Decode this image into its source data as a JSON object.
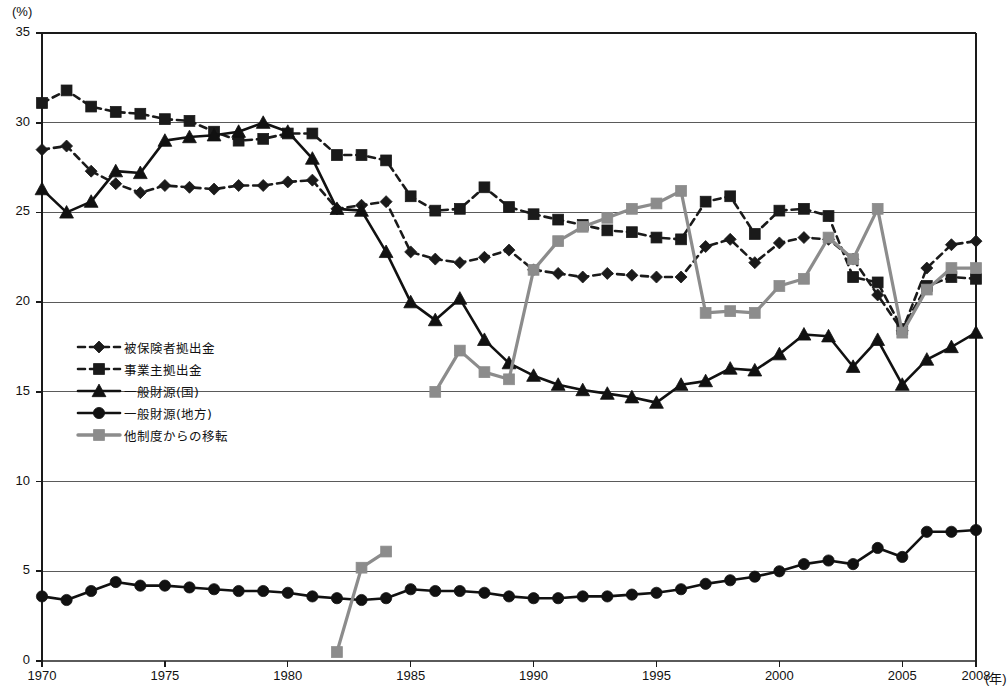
{
  "chart_data": {
    "type": "line",
    "title": "",
    "xlabel": "(年)",
    "ylabel": "(%)",
    "unit_y": "(%)",
    "unit_x": "(年)",
    "xlim": [
      1970,
      2008
    ],
    "ylim": [
      0,
      35
    ],
    "ytick_step": 5,
    "yticks": [
      "0",
      "5",
      "10",
      "15",
      "20",
      "25",
      "30",
      "35"
    ],
    "xticks": [
      "1970",
      "1975",
      "1980",
      "1985",
      "1990",
      "1995",
      "2000",
      "2005",
      "2008"
    ],
    "xtick_values": [
      1970,
      1975,
      1980,
      1985,
      1990,
      1995,
      2000,
      2005,
      2008
    ],
    "grid": "horizontal",
    "legend_position": "inside-left",
    "x": [
      1970,
      1971,
      1972,
      1973,
      1974,
      1975,
      1976,
      1977,
      1978,
      1979,
      1980,
      1981,
      1982,
      1983,
      1984,
      1985,
      1986,
      1987,
      1988,
      1989,
      1990,
      1991,
      1992,
      1993,
      1994,
      1995,
      1996,
      1997,
      1998,
      1999,
      2000,
      2001,
      2002,
      2003,
      2004,
      2005,
      2006,
      2007,
      2008
    ],
    "series": [
      {
        "name": "被保険者拠出金",
        "marker": "diamond",
        "line": "dashed",
        "color": "#1a1a1a",
        "values": [
          28.5,
          28.7,
          27.3,
          26.6,
          26.1,
          26.5,
          26.4,
          26.3,
          26.5,
          26.5,
          26.7,
          26.8,
          25.2,
          25.4,
          25.6,
          22.8,
          22.4,
          22.2,
          22.5,
          22.9,
          21.8,
          21.6,
          21.4,
          21.6,
          21.5,
          21.4,
          21.4,
          23.1,
          23.5,
          22.2,
          23.3,
          23.6,
          23.5,
          22.4,
          20.4,
          18.4,
          21.9,
          23.2,
          23.4
        ]
      },
      {
        "name": "事業主拠出金",
        "marker": "square",
        "line": "dashed",
        "color": "#1a1a1a",
        "values": [
          31.1,
          31.8,
          30.9,
          30.6,
          30.5,
          30.2,
          30.1,
          29.5,
          29.0,
          29.1,
          29.4,
          29.4,
          28.2,
          28.2,
          27.9,
          25.9,
          25.1,
          25.2,
          26.4,
          25.3,
          24.9,
          24.6,
          24.3,
          24.0,
          23.9,
          23.6,
          23.5,
          25.6,
          25.9,
          23.8,
          25.1,
          25.2,
          24.8,
          21.4,
          21.1,
          18.5,
          20.9,
          21.4,
          21.3
        ]
      },
      {
        "name": "一般財源(国)",
        "marker": "triangle",
        "line": "solid",
        "color": "#111111",
        "values": [
          26.3,
          25.0,
          25.6,
          27.3,
          27.2,
          29.0,
          29.2,
          29.3,
          29.5,
          30.0,
          29.5,
          28.0,
          25.2,
          25.1,
          22.8,
          20.0,
          19.0,
          20.2,
          17.9,
          16.6,
          15.9,
          15.4,
          15.1,
          14.9,
          14.7,
          14.4,
          15.4,
          15.6,
          16.3,
          16.2,
          17.1,
          18.2,
          18.1,
          16.4,
          17.9,
          15.4,
          16.8,
          17.5,
          18.3
        ]
      },
      {
        "name": "一般財源(地方)",
        "marker": "circle",
        "line": "solid",
        "color": "#111111",
        "values": [
          3.6,
          3.4,
          3.9,
          4.4,
          4.2,
          4.2,
          4.1,
          4.0,
          3.9,
          3.9,
          3.8,
          3.6,
          3.5,
          3.4,
          3.5,
          4.0,
          3.9,
          3.9,
          3.8,
          3.6,
          3.5,
          3.5,
          3.6,
          3.6,
          3.7,
          3.8,
          4.0,
          4.3,
          4.5,
          4.7,
          5.0,
          5.4,
          5.6,
          5.4,
          6.3,
          5.8,
          7.2,
          7.2,
          7.3
        ]
      },
      {
        "name": "他制度からの移転",
        "marker": "square",
        "line": "solid",
        "color": "#8c8c8c",
        "values": [
          null,
          null,
          null,
          null,
          null,
          null,
          null,
          null,
          null,
          null,
          null,
          null,
          0.5,
          5.2,
          6.1,
          null,
          15.0,
          17.3,
          16.1,
          15.7,
          21.8,
          23.4,
          24.2,
          24.7,
          25.2,
          25.5,
          26.2,
          19.4,
          19.5,
          19.4,
          20.9,
          21.3,
          23.6,
          22.4,
          25.2,
          18.3,
          20.7,
          21.9,
          21.9
        ]
      }
    ]
  },
  "legend": {
    "items": [
      {
        "label": "被保険者拠出金",
        "marker": "diamond",
        "line": "dashed",
        "color": "#1a1a1a"
      },
      {
        "label": "事業主拠出金",
        "marker": "square",
        "line": "dashed",
        "color": "#1a1a1a"
      },
      {
        "label": "一般財源(国)",
        "marker": "triangle",
        "line": "solid",
        "color": "#111111"
      },
      {
        "label": "一般財源(地方)",
        "marker": "circle",
        "line": "solid",
        "color": "#111111"
      },
      {
        "label": "他制度からの移転",
        "marker": "square",
        "line": "solid",
        "color": "#8c8c8c"
      }
    ]
  },
  "caption": {
    "text": ""
  },
  "colors": {
    "axis": "#1a1a1a",
    "grid": "#5a5a5a",
    "dark": "#111111",
    "gray": "#8c8c8c",
    "background": "#ffffff"
  }
}
